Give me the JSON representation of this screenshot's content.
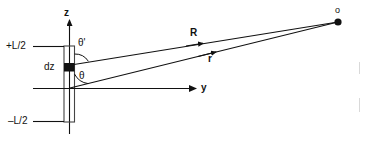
{
  "figure": {
    "kind": "physics-diagram",
    "background_color": "#ffffff",
    "stroke_color": "#111111",
    "labels": {
      "axis_z": "z",
      "axis_y": "y",
      "top_end": "+L/2",
      "bottom_end": "–L/2",
      "element": "dz",
      "angle_upper": "θ'",
      "angle_lower": "θ",
      "vector_upper": "R",
      "vector_lower": "r",
      "field_point": "o"
    },
    "geometry": {
      "rod_x_left": 64,
      "rod_x_right": 74,
      "rod_top_y": 46,
      "rod_bottom_y": 122,
      "axis_origin_x": 69,
      "axis_origin_y": 88,
      "element_y": 67,
      "field_point_x": 338,
      "field_point_y": 22,
      "y_axis_end_x": 196,
      "z_axis_top_y": 18
    }
  }
}
